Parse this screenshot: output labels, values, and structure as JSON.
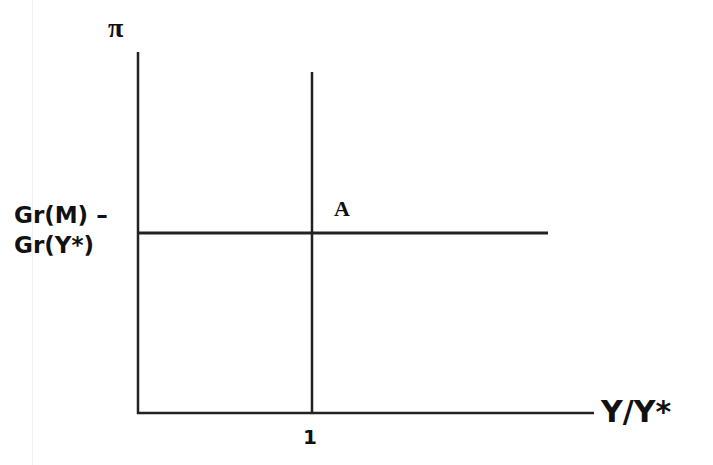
{
  "diagram": {
    "y_axis_label": "π",
    "x_axis_label": "Y/Y*",
    "horizontal_line_label_line1": "Gr(M) –",
    "horizontal_line_label_line2": "Gr(Y*)",
    "vertical_line_tick_label": "1",
    "intersection_label": "A",
    "colors": {
      "line": "#222222",
      "text": "#111111",
      "background": "#ffffff"
    }
  }
}
